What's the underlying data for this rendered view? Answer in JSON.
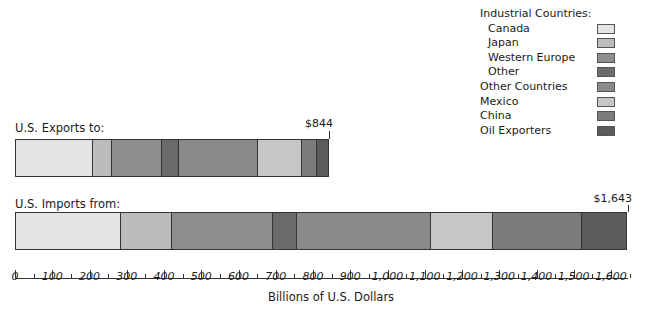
{
  "legend": {
    "items": [
      {
        "label": "Industrial Countries:",
        "indent": false,
        "color": null
      },
      {
        "label": "Canada",
        "indent": true,
        "color": "#e4e4e4"
      },
      {
        "label": "Japan",
        "indent": true,
        "color": "#bcbcbc"
      },
      {
        "label": "Western Europe",
        "indent": true,
        "color": "#8e8e8e"
      },
      {
        "label": "Other",
        "indent": true,
        "color": "#6a6a6a"
      },
      {
        "label": "Other Countries",
        "indent": false,
        "color": "#8a8a8a"
      },
      {
        "label": "Mexico",
        "indent": false,
        "color": "#c6c6c6"
      },
      {
        "label": "China",
        "indent": false,
        "color": "#7c7c7c"
      },
      {
        "label": "Oil Exporters",
        "indent": false,
        "color": "#5c5c5c"
      }
    ]
  },
  "exports": {
    "label": "U.S. Exports to:",
    "total_label": "$844"
  },
  "imports": {
    "label": "U.S. Imports from:",
    "total_label": "$1,643"
  },
  "axis": {
    "ticks": [
      "0",
      "100",
      "200",
      "300",
      "400",
      "500",
      "600",
      "700",
      "800",
      "900",
      "1,000",
      "1,100",
      "1,200",
      "1,300",
      "1,400",
      "1,500",
      "1,600"
    ],
    "xlabel": "Billions of U.S. Dollars"
  },
  "chart_data": {
    "type": "bar",
    "orientation": "horizontal",
    "stacked": true,
    "title": "",
    "xlabel": "Billions of U.S. Dollars",
    "ylabel": "",
    "xlim": [
      0,
      1650
    ],
    "grid": false,
    "legend_position": "top-right",
    "categories": [
      "U.S. Exports to:",
      "U.S. Imports from:"
    ],
    "totals": [
      844,
      1643
    ],
    "total_labels": [
      "$844",
      "$1,643"
    ],
    "series": [
      {
        "name": "Canada",
        "group": "Industrial Countries",
        "color": "#e4e4e4",
        "values": [
          207,
          282
        ]
      },
      {
        "name": "Japan",
        "group": "Industrial Countries",
        "color": "#bcbcbc",
        "values": [
          53,
          137
        ]
      },
      {
        "name": "Western Europe",
        "group": "Industrial Countries",
        "color": "#8e8e8e",
        "values": [
          135,
          274
        ]
      },
      {
        "name": "Other",
        "group": "Industrial Countries",
        "color": "#6a6a6a",
        "values": [
          45,
          64
        ]
      },
      {
        "name": "Other Countries",
        "color": "#8a8a8a",
        "values": [
          215,
          362
        ]
      },
      {
        "name": "Mexico",
        "color": "#c6c6c6",
        "values": [
          118,
          166
        ]
      },
      {
        "name": "China",
        "color": "#7c7c7c",
        "values": [
          40,
          239
        ]
      },
      {
        "name": "Oil Exporters",
        "color": "#5c5c5c",
        "values": [
          31,
          119
        ]
      }
    ],
    "tick_labels": [
      "0",
      "100",
      "200",
      "300",
      "400",
      "500",
      "600",
      "700",
      "800",
      "900",
      "1,000",
      "1,100",
      "1,200",
      "1,300",
      "1,400",
      "1,500",
      "1,600"
    ]
  }
}
